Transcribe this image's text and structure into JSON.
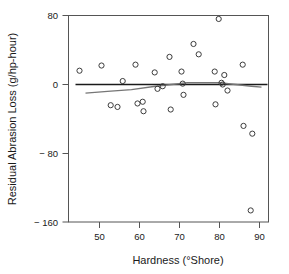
{
  "chart_data": {
    "type": "scatter",
    "title": "",
    "xlabel": "Hardness (°Shore)",
    "ylabel": "Residual Abrasion Loss (g/hp-hour)",
    "xlim": [
      44,
      92
    ],
    "ylim": [
      -168,
      80
    ],
    "xticks": [
      50,
      60,
      70,
      80,
      90
    ],
    "xtick_labels": [
      "50",
      "60",
      "70",
      "80",
      "90"
    ],
    "yticks": [
      80,
      0,
      -80,
      -160
    ],
    "ytick_labels": [
      "80",
      "0",
      "− 80",
      "− 160"
    ],
    "grid": false,
    "legend": null,
    "marker": "open-circle",
    "marker_color": "#3c3c3c",
    "points": [
      {
        "x": 45.0,
        "y": 16
      },
      {
        "x": 50.5,
        "y": 22
      },
      {
        "x": 52.8,
        "y": -24
      },
      {
        "x": 54.5,
        "y": -26
      },
      {
        "x": 55.8,
        "y": 4
      },
      {
        "x": 59.0,
        "y": 23
      },
      {
        "x": 59.5,
        "y": -22
      },
      {
        "x": 60.8,
        "y": -20
      },
      {
        "x": 61.0,
        "y": -31
      },
      {
        "x": 63.8,
        "y": 14
      },
      {
        "x": 64.5,
        "y": -5
      },
      {
        "x": 65.8,
        "y": -2
      },
      {
        "x": 67.5,
        "y": 32
      },
      {
        "x": 67.8,
        "y": -29
      },
      {
        "x": 70.5,
        "y": 15
      },
      {
        "x": 70.8,
        "y": 1
      },
      {
        "x": 71.0,
        "y": -12
      },
      {
        "x": 73.5,
        "y": 47
      },
      {
        "x": 74.8,
        "y": 35
      },
      {
        "x": 78.8,
        "y": 15
      },
      {
        "x": 79.0,
        "y": -23
      },
      {
        "x": 79.8,
        "y": 76
      },
      {
        "x": 80.5,
        "y": 2
      },
      {
        "x": 80.8,
        "y": 0
      },
      {
        "x": 81.2,
        "y": 11
      },
      {
        "x": 82.0,
        "y": -7
      },
      {
        "x": 85.8,
        "y": 23
      },
      {
        "x": 86.0,
        "y": -48
      },
      {
        "x": 88.2,
        "y": -57
      },
      {
        "x": 87.8,
        "y": -146
      }
    ],
    "reference_line": {
      "name": "zero-line",
      "y": 0,
      "color": "#1a1a1a",
      "x_from": 44,
      "x_to": 92
    },
    "smooth_curve": {
      "name": "lowess-smooth",
      "color": "#767676",
      "points": [
        {
          "x": 46.5,
          "y": -10
        },
        {
          "x": 52.0,
          "y": -8
        },
        {
          "x": 58.0,
          "y": -6
        },
        {
          "x": 64.0,
          "y": -2
        },
        {
          "x": 68.0,
          "y": 0
        },
        {
          "x": 72.0,
          "y": 2
        },
        {
          "x": 76.0,
          "y": 2
        },
        {
          "x": 80.0,
          "y": 2
        },
        {
          "x": 84.0,
          "y": 0
        },
        {
          "x": 88.0,
          "y": -2
        },
        {
          "x": 90.5,
          "y": -3
        }
      ]
    }
  }
}
